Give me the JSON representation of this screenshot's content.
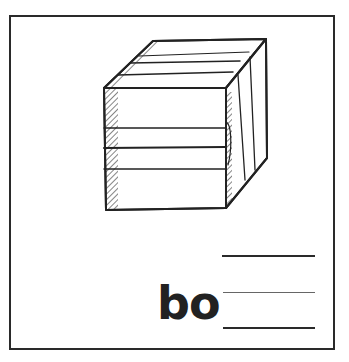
{
  "worksheet": {
    "picture": "box-icon",
    "word_prefix": "bo",
    "answer_blanks": 1,
    "guide_lines": [
      "top-line",
      "mid-line",
      "base-line"
    ]
  },
  "colors": {
    "ink": "#2a2a2a",
    "background": "#ffffff"
  }
}
